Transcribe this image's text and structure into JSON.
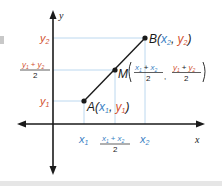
{
  "colors": {
    "axis": "#1a1a1a",
    "segment": "#1a1a1a",
    "x_label": "#3b7fc4",
    "y_label": "#d2502f",
    "guide": "#bcd8ef",
    "point_label": "#1a1a1a",
    "bottom_strip": "#e6e6e6"
  },
  "axes": {
    "x_label": "x",
    "y_label": "y"
  },
  "points": {
    "A": {
      "name": "A",
      "open": "(",
      "x": "x",
      "x_sub": "1",
      "sep": ", ",
      "y": "y",
      "y_sub": "1",
      "close": ")"
    },
    "B": {
      "name": "B",
      "open": "(",
      "x": "x",
      "x_sub": "2",
      "sep": ", ",
      "y": "y",
      "y_sub": "2",
      "close": ")"
    },
    "M": {
      "name": "M",
      "x_num": {
        "a": "x",
        "a_sub": "1",
        "plus": "+",
        "b": "x",
        "b_sub": "2"
      },
      "x_den": "2",
      "sep": ",",
      "y_num": {
        "a": "y",
        "a_sub": "1",
        "plus": "+",
        "b": "y",
        "b_sub": "2"
      },
      "y_den": "2"
    }
  },
  "y_ticks": {
    "y2": {
      "v": "y",
      "sub": "2"
    },
    "mid": {
      "a": "y",
      "a_sub": "1",
      "plus": "+",
      "b": "y",
      "b_sub": "2",
      "den": "2"
    },
    "y1": {
      "v": "y",
      "sub": "1"
    }
  },
  "x_ticks": {
    "x1": {
      "v": "x",
      "sub": "1"
    },
    "mid": {
      "a": "x",
      "a_sub": "1",
      "plus": "+",
      "b": "x",
      "b_sub": "2",
      "den": "2"
    },
    "x2": {
      "v": "x",
      "sub": "2"
    }
  }
}
